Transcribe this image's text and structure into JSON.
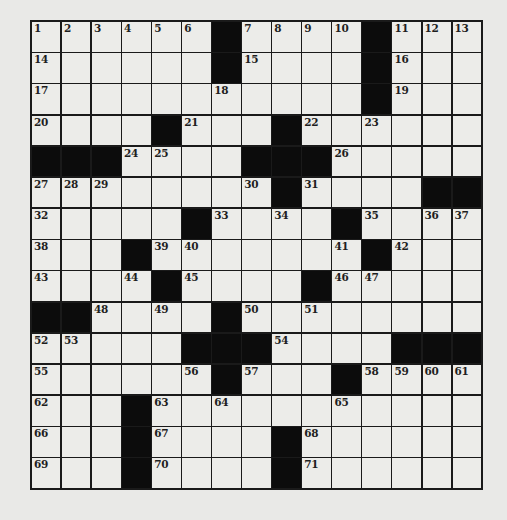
{
  "puzzle": {
    "rows": 15,
    "cols": 15,
    "grid": [
      [
        1,
        2,
        3,
        4,
        5,
        6,
        "#",
        7,
        8,
        9,
        10,
        "#",
        11,
        12,
        13
      ],
      [
        14,
        0,
        0,
        0,
        0,
        0,
        "#",
        15,
        0,
        0,
        0,
        "#",
        16,
        0,
        0
      ],
      [
        17,
        0,
        0,
        0,
        0,
        0,
        18,
        0,
        0,
        0,
        0,
        "#",
        19,
        0,
        0
      ],
      [
        20,
        0,
        0,
        0,
        "#",
        21,
        0,
        0,
        "#",
        22,
        0,
        23,
        0,
        0,
        0
      ],
      [
        "#",
        "#",
        "#",
        24,
        25,
        0,
        0,
        "#",
        "#",
        "#",
        26,
        0,
        0,
        0,
        0
      ],
      [
        27,
        28,
        29,
        0,
        0,
        0,
        0,
        30,
        "#",
        31,
        0,
        0,
        0,
        "#",
        "#"
      ],
      [
        32,
        0,
        0,
        0,
        0,
        "#",
        33,
        0,
        34,
        0,
        "#",
        35,
        0,
        36,
        37
      ],
      [
        38,
        0,
        0,
        "#",
        39,
        40,
        0,
        0,
        0,
        0,
        41,
        "#",
        42,
        0,
        0
      ],
      [
        43,
        0,
        0,
        44,
        "#",
        45,
        0,
        0,
        0,
        "#",
        46,
        47,
        0,
        0,
        0
      ],
      [
        "#",
        "#",
        48,
        0,
        49,
        0,
        "#",
        50,
        0,
        51,
        0,
        0,
        0,
        0,
        0
      ],
      [
        52,
        53,
        0,
        0,
        0,
        "#",
        "#",
        "#",
        54,
        0,
        0,
        0,
        "#",
        "#",
        "#"
      ],
      [
        55,
        0,
        0,
        0,
        0,
        56,
        "#",
        57,
        0,
        0,
        "#",
        58,
        59,
        60,
        61
      ],
      [
        62,
        0,
        0,
        "#",
        63,
        0,
        64,
        0,
        0,
        0,
        65,
        0,
        0,
        0,
        0
      ],
      [
        66,
        0,
        0,
        "#",
        67,
        0,
        0,
        0,
        "#",
        68,
        0,
        0,
        0,
        0,
        0
      ],
      [
        69,
        0,
        0,
        "#",
        70,
        0,
        0,
        0,
        "#",
        71,
        0,
        0,
        0,
        0,
        0
      ]
    ]
  },
  "colors": {
    "background": "#e9e9e7",
    "cell": "#ecece9",
    "block": "#0c0c0c",
    "line": "#1a1a1a"
  }
}
